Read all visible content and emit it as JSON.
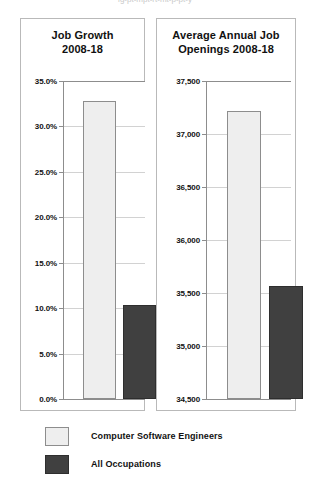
{
  "top_sliver_text": "ig-pt-mpt-rt-mt-p-pt-y",
  "legend": [
    {
      "key": "cse",
      "label": "Computer Software Engineers",
      "color": "#eeeeee",
      "swatch": "light"
    },
    {
      "key": "all",
      "label": "All Occupations",
      "color": "#404040",
      "swatch": "dark"
    }
  ],
  "chart_data": [
    {
      "id": "job-growth",
      "type": "bar",
      "title": "Job Growth 2008-18",
      "title_line1": "Job Growth",
      "title_line2": "2008-18",
      "xlabel": "",
      "ylabel": "",
      "ylim": [
        0,
        35
      ],
      "yticks": [
        0,
        5,
        10,
        15,
        20,
        25,
        30,
        35
      ],
      "ytick_labels": [
        "0.0%",
        "5.0%",
        "10.0%",
        "15.0%",
        "20.0%",
        "25.0%",
        "30.0%",
        "35.0%"
      ],
      "grid": true,
      "legend_position": "below-figure",
      "categories": [
        "Computer Software Engineers",
        "All Occupations"
      ],
      "values": [
        32.8,
        10.3
      ],
      "value_labels": [
        "32.8%",
        "10.3%"
      ],
      "colors": [
        "#eeeeee",
        "#404040"
      ]
    },
    {
      "id": "annual-openings",
      "type": "bar",
      "title": "Average Annual Job Openings 2008-18",
      "title_line1": "Average Annual Job",
      "title_line2": "Openings 2008-18",
      "xlabel": "",
      "ylabel": "",
      "ylim": [
        34500,
        37500
      ],
      "yticks": [
        34500,
        35000,
        35500,
        36000,
        36500,
        37000,
        37500
      ],
      "ytick_labels": [
        "34,500",
        "35,000",
        "35,500",
        "36,000",
        "36,500",
        "37,000",
        "37,500"
      ],
      "grid": true,
      "legend_position": "below-figure",
      "categories": [
        "Computer Software Engineers",
        "All Occupations"
      ],
      "values": [
        37220,
        35570
      ],
      "value_labels": [
        "37,220",
        "35,570"
      ],
      "colors": [
        "#eeeeee",
        "#404040"
      ]
    }
  ]
}
